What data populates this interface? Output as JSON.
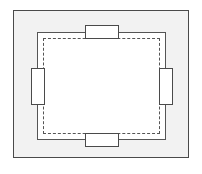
{
  "diagram": {
    "type": "schematic-plan-view",
    "canvas": {
      "width": 202,
      "height": 174,
      "background_color": "#ffffff"
    },
    "outer_panel": {
      "label": "",
      "fill_color": "#f2f2f2",
      "stroke_color": "#4a4a4a",
      "stroke_style": "solid",
      "x": 13,
      "y": 10,
      "width": 176,
      "height": 148
    },
    "solid_boundary": {
      "label": "",
      "fill_color": "#ffffff",
      "stroke_color": "#555555",
      "stroke_style": "solid",
      "x": 37,
      "y": 32,
      "width": 129,
      "height": 108
    },
    "dashed_boundary": {
      "label": "",
      "fill_color": "transparent",
      "stroke_color": "#555555",
      "stroke_style": "dashed",
      "x": 43,
      "y": 38,
      "width": 117,
      "height": 96
    },
    "components": [
      {
        "name": "top-component",
        "label": "",
        "orientation": "horizontal",
        "fill_color": "#ffffff",
        "stroke_color": "#4a4a4a",
        "x": 85,
        "y": 25,
        "width": 34,
        "height": 14
      },
      {
        "name": "right-component",
        "label": "",
        "orientation": "vertical",
        "fill_color": "#ffffff",
        "stroke_color": "#4a4a4a",
        "x": 159,
        "y": 68,
        "width": 14,
        "height": 37
      },
      {
        "name": "bottom-component",
        "label": "",
        "orientation": "horizontal",
        "fill_color": "#ffffff",
        "stroke_color": "#4a4a4a",
        "x": 85,
        "y": 133,
        "width": 34,
        "height": 14
      },
      {
        "name": "left-component",
        "label": "",
        "orientation": "vertical",
        "fill_color": "#ffffff",
        "stroke_color": "#4a4a4a",
        "x": 31,
        "y": 68,
        "width": 14,
        "height": 37
      }
    ]
  }
}
